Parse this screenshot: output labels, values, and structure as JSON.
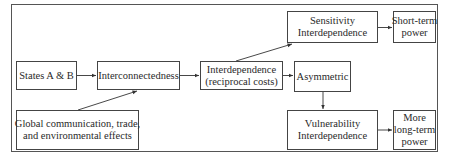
{
  "diagram": {
    "nodes": {
      "states": {
        "lines": [
          "States A & B"
        ]
      },
      "interconnectedness": {
        "lines": [
          "Interconnectedness"
        ]
      },
      "interdependence": {
        "lines": [
          "Interdependence",
          "(reciprocal costs)"
        ]
      },
      "asymmetric": {
        "lines": [
          "Asymmetric"
        ]
      },
      "sensitivity": {
        "lines": [
          "Sensitivity",
          "Interdependence"
        ]
      },
      "short_term": {
        "lines": [
          "Short-term",
          "power"
        ]
      },
      "global": {
        "lines": [
          "Global communication, trade,",
          "and environmental effects"
        ]
      },
      "vulnerability": {
        "lines": [
          "Vulnerability",
          "Interdependence"
        ]
      },
      "long_term": {
        "lines": [
          "More",
          "long-term",
          "power"
        ]
      }
    },
    "edges": [
      {
        "from": "States A & B",
        "to": "Interconnectedness"
      },
      {
        "from": "Global communication, trade, and environmental effects",
        "to": "Interconnectedness"
      },
      {
        "from": "Interconnectedness",
        "to": "Interdependence (reciprocal costs)"
      },
      {
        "from": "Interdependence (reciprocal costs)",
        "to": "Sensitivity Interdependence"
      },
      {
        "from": "Interdependence (reciprocal costs)",
        "to": "Asymmetric"
      },
      {
        "from": "Asymmetric",
        "to": "Vulnerability Interdependence"
      },
      {
        "from": "Sensitivity Interdependence",
        "to": "Short-term power"
      },
      {
        "from": "Vulnerability Interdependence",
        "to": "More long-term power"
      }
    ],
    "colors": {
      "line": "#333333",
      "background": "#ffffff"
    }
  }
}
